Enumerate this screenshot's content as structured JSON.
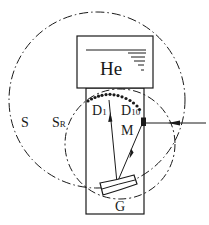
{
  "diagram": {
    "type": "optical-schematic",
    "colors": {
      "line": "#1a1a1a",
      "background": "#ffffff"
    },
    "labels": {
      "source": "He",
      "large_circle": "S",
      "rowland_circle": {
        "main": "S",
        "sub": "R"
      },
      "detector_first": {
        "main": "D",
        "sub": "1"
      },
      "detector_last": {
        "main": "D",
        "sub": "10"
      },
      "mirror": "M",
      "grating": "G"
    },
    "elements": {
      "large_circle": {
        "style": "dash-dot",
        "cx": 97,
        "cy": 100,
        "r": 88
      },
      "rowland_circle": {
        "style": "dashed",
        "cx": 120,
        "cy": 144,
        "r": 55
      },
      "detector_array": {
        "count": 15,
        "style": "dotted-arc"
      },
      "input_arrow": {
        "direction": "left"
      }
    }
  }
}
